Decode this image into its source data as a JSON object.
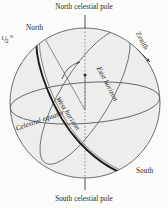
{
  "figure": {
    "kind": "celestial-sphere-diagram",
    "width": 168,
    "height": 208,
    "background_color": "#fbfbfa",
    "sphere_fill": "#ededeb",
    "line_color": "#55555a",
    "bold_line_color": "#1d1d1f",
    "text_color": "#231f20"
  },
  "labels": {
    "north_celestial_pole": "North celestial pole",
    "south_celestial_pole": "South celestial pole",
    "north": "North",
    "south": "South",
    "zenith": "Zenith",
    "east_horizon": "East horizon",
    "west_horizon": "West horizon",
    "celestial_equator": "Celestial equator",
    "half_degree_numerator": "1",
    "half_degree_bar": "/",
    "half_degree_denominator": "2",
    "half_degree_unit": "°",
    "half_degree_full": "1/2°"
  }
}
